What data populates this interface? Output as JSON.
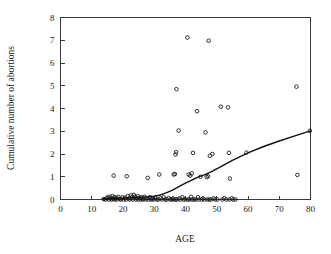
{
  "chart_data": {
    "type": "scatter",
    "title": "",
    "xlabel": "AGE",
    "ylabel": "Cumulative number of abortions",
    "xlim": [
      0,
      80
    ],
    "ylim": [
      0,
      8
    ],
    "xticks": [
      0,
      10,
      20,
      30,
      40,
      50,
      60,
      70,
      80
    ],
    "yticks": [
      0,
      1,
      2,
      3,
      4,
      5,
      6,
      7,
      8
    ],
    "xticklabels": [
      "0",
      "10",
      "20",
      "30",
      "40",
      "50",
      "60",
      "70",
      "80"
    ],
    "yticklabels": [
      "0",
      "1",
      "2",
      "3",
      "4",
      "5",
      "6",
      "7",
      "8"
    ],
    "grid": false,
    "legend": null,
    "marker": "open-circle",
    "marker_color": "#1a1a1a",
    "points": [
      [
        13.8,
        0.02
      ],
      [
        14.3,
        0.0
      ],
      [
        14.8,
        0.05
      ],
      [
        15.1,
        0.1
      ],
      [
        15.4,
        0.0
      ],
      [
        15.7,
        0.12
      ],
      [
        16.0,
        0.05
      ],
      [
        16.3,
        0.0
      ],
      [
        16.6,
        0.15
      ],
      [
        16.9,
        0.02
      ],
      [
        17.2,
        0.1
      ],
      [
        17.4,
        0.0
      ],
      [
        17.0,
        1.05
      ],
      [
        17.8,
        0.07
      ],
      [
        18.1,
        0.0
      ],
      [
        18.5,
        0.12
      ],
      [
        18.9,
        0.03
      ],
      [
        19.3,
        0.0
      ],
      [
        19.8,
        0.1
      ],
      [
        20.2,
        0.0
      ],
      [
        20.6,
        0.08
      ],
      [
        21.0,
        0.0
      ],
      [
        21.2,
        1.02
      ],
      [
        21.5,
        0.15
      ],
      [
        21.9,
        0.05
      ],
      [
        22.2,
        0.0
      ],
      [
        22.6,
        0.18
      ],
      [
        22.9,
        0.1
      ],
      [
        23.2,
        0.0
      ],
      [
        23.5,
        0.2
      ],
      [
        23.8,
        0.12
      ],
      [
        24.1,
        0.0
      ],
      [
        24.4,
        0.05
      ],
      [
        24.7,
        0.15
      ],
      [
        25.0,
        0.0
      ],
      [
        25.3,
        0.08
      ],
      [
        25.6,
        0.0
      ],
      [
        25.9,
        0.1
      ],
      [
        26.2,
        0.02
      ],
      [
        26.5,
        0.0
      ],
      [
        26.9,
        0.12
      ],
      [
        27.3,
        0.0
      ],
      [
        27.7,
        0.05
      ],
      [
        27.9,
        0.95
      ],
      [
        28.2,
        0.0
      ],
      [
        28.6,
        0.1
      ],
      [
        29.0,
        0.0
      ],
      [
        29.4,
        0.03
      ],
      [
        29.8,
        0.0
      ],
      [
        30.3,
        0.08
      ],
      [
        30.8,
        0.0
      ],
      [
        31.3,
        0.0
      ],
      [
        31.6,
        1.1
      ],
      [
        32.0,
        0.05
      ],
      [
        32.5,
        0.0
      ],
      [
        33.0,
        0.1
      ],
      [
        33.5,
        0.0
      ],
      [
        34.0,
        0.0
      ],
      [
        34.6,
        0.06
      ],
      [
        35.1,
        0.0
      ],
      [
        35.6,
        0.0
      ],
      [
        36.0,
        0.05
      ],
      [
        36.2,
        1.1
      ],
      [
        36.3,
        0.0
      ],
      [
        36.6,
        1.12
      ],
      [
        36.8,
        1.98
      ],
      [
        36.9,
        0.0
      ],
      [
        37.0,
        2.08
      ],
      [
        37.1,
        4.85
      ],
      [
        37.4,
        0.0
      ],
      [
        37.8,
        3.03
      ],
      [
        38.0,
        0.05
      ],
      [
        38.4,
        0.0
      ],
      [
        39.0,
        0.1
      ],
      [
        39.4,
        0.0
      ],
      [
        40.0,
        0.0
      ],
      [
        40.6,
        7.12
      ],
      [
        40.8,
        0.0
      ],
      [
        41.0,
        1.1
      ],
      [
        41.3,
        0.0
      ],
      [
        41.5,
        1.05
      ],
      [
        41.8,
        0.12
      ],
      [
        42.0,
        1.15
      ],
      [
        42.2,
        0.0
      ],
      [
        42.4,
        2.05
      ],
      [
        42.8,
        0.0
      ],
      [
        43.3,
        0.0
      ],
      [
        43.7,
        3.88
      ],
      [
        44.0,
        0.1
      ],
      [
        44.3,
        0.0
      ],
      [
        44.8,
        1.0
      ],
      [
        45.2,
        0.0
      ],
      [
        45.6,
        0.05
      ],
      [
        46.0,
        0.0
      ],
      [
        46.4,
        2.95
      ],
      [
        46.8,
        0.98
      ],
      [
        47.0,
        0.0
      ],
      [
        47.2,
        1.02
      ],
      [
        47.4,
        6.98
      ],
      [
        47.6,
        0.0
      ],
      [
        47.8,
        1.92
      ],
      [
        48.2,
        0.0
      ],
      [
        48.6,
        2.0
      ],
      [
        49.0,
        0.05
      ],
      [
        49.5,
        0.0
      ],
      [
        50.2,
        0.0
      ],
      [
        51.3,
        4.08
      ],
      [
        51.8,
        0.0
      ],
      [
        52.4,
        0.06
      ],
      [
        53.0,
        0.0
      ],
      [
        53.6,
        4.05
      ],
      [
        53.9,
        2.05
      ],
      [
        54.0,
        0.0
      ],
      [
        54.2,
        0.92
      ],
      [
        54.8,
        0.05
      ],
      [
        55.3,
        0.0
      ],
      [
        56.0,
        0.0
      ],
      [
        59.5,
        2.06
      ],
      [
        75.5,
        4.96
      ],
      [
        75.8,
        1.08
      ],
      [
        79.8,
        3.02
      ]
    ],
    "fit_curve": {
      "name": "smoothed-fit-line",
      "x": [
        13.5,
        17,
        20,
        23,
        26,
        28,
        30,
        32,
        34,
        36,
        38,
        40,
        42,
        44,
        46,
        48,
        50,
        55,
        60,
        65,
        70,
        75,
        80
      ],
      "y": [
        0.04,
        0.05,
        0.06,
        0.08,
        0.1,
        0.12,
        0.15,
        0.2,
        0.3,
        0.42,
        0.58,
        0.72,
        0.85,
        0.98,
        1.08,
        1.2,
        1.35,
        1.72,
        2.05,
        2.33,
        2.57,
        2.8,
        3.02
      ]
    }
  },
  "axes": {
    "x_title": "AGE",
    "y_title": "Cumulative number of abortions"
  }
}
